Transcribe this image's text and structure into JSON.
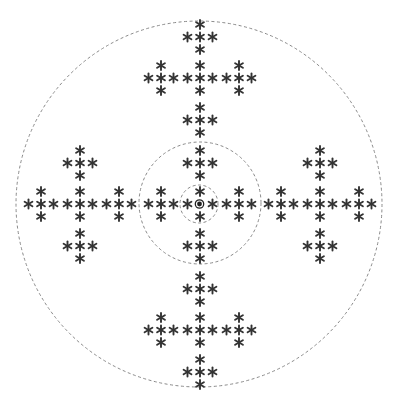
{
  "diagram": {
    "title": "",
    "canvas": {
      "width": 397,
      "height": 406
    },
    "center": {
      "x": 200,
      "y": 204
    },
    "colors": {
      "background": "#ffffff",
      "asterisk": "#333333",
      "ring": "#8a8a8a",
      "bullseye": "#222222"
    },
    "rings": [
      {
        "name": "outer-ring",
        "cx": 199,
        "cy": 204,
        "r": 183
      },
      {
        "name": "middle-ring",
        "cx": 200,
        "cy": 203,
        "r": 61
      },
      {
        "name": "inner-ring",
        "cx": 199,
        "cy": 204,
        "r": 19
      }
    ],
    "cluster_offsets": [
      {
        "name": "center-cluster",
        "dx": 0,
        "dy": 0
      },
      {
        "name": "top-cluster",
        "dx": 0,
        "dy": -126
      },
      {
        "name": "bottom-cluster",
        "dx": 0,
        "dy": 126
      },
      {
        "name": "left-cluster",
        "dx": -120,
        "dy": 0
      },
      {
        "name": "right-cluster",
        "dx": 120,
        "dy": 0
      }
    ],
    "group_offsets": [
      {
        "name": "center-group",
        "dx": 0,
        "dy": 0
      },
      {
        "name": "top-group",
        "dx": 0,
        "dy": -41
      },
      {
        "name": "bottom-group",
        "dx": 0,
        "dy": 42
      },
      {
        "name": "left-group",
        "dx": -39,
        "dy": 0
      },
      {
        "name": "right-group",
        "dx": 39,
        "dy": 0
      }
    ],
    "asterisk_offsets": [
      {
        "dx": 0,
        "dy": 0
      },
      {
        "dx": 0,
        "dy": -12.5
      },
      {
        "dx": 0,
        "dy": 12.5
      },
      {
        "dx": -12.5,
        "dy": 0
      },
      {
        "dx": 12.5,
        "dy": 0
      }
    ],
    "asterisk_glyph": "asterisk-icon",
    "asterisk_size": 9,
    "center_symbol": {
      "icon": "bullseye-icon",
      "outer_r": 4.2,
      "inner_r": 2.4
    }
  }
}
